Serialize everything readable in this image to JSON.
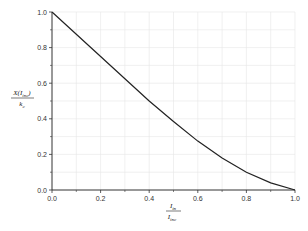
{
  "chart_data": {
    "type": "line",
    "title": "",
    "xlabel": {
      "numerator": "I",
      "numerator_sub": "in",
      "denominator": "I",
      "denominator_sub": "inc"
    },
    "ylabel": {
      "numerator": "X(I",
      "numerator_sub": "inc",
      "numerator_tail": ")",
      "denominator": "k",
      "denominator_sub": "c"
    },
    "xlim": [
      0.0,
      1.0
    ],
    "ylim": [
      0.0,
      1.0
    ],
    "xticks": [
      "0.0",
      "0.2",
      "0.4",
      "0.6",
      "0.8",
      "1.0"
    ],
    "yticks": [
      "0.0",
      "0.2",
      "0.4",
      "0.6",
      "0.8",
      "1.0"
    ],
    "grid": true,
    "legend": null,
    "series": [
      {
        "name": "curve",
        "color": "#222222",
        "x": [
          0.0,
          0.1,
          0.2,
          0.3,
          0.4,
          0.5,
          0.6,
          0.7,
          0.8,
          0.9,
          1.0
        ],
        "y": [
          1.0,
          0.875,
          0.75,
          0.625,
          0.5,
          0.385,
          0.275,
          0.18,
          0.1,
          0.04,
          0.0
        ]
      }
    ]
  },
  "style": {
    "grid_color": "#e6e6e6",
    "axis_color": "#333333",
    "line_color": "#222222"
  }
}
